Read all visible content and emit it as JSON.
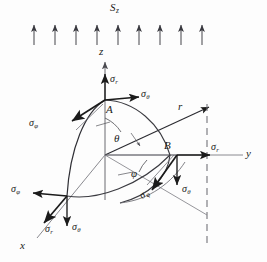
{
  "figure": {
    "title_label": "S",
    "title_sub": "z",
    "background_color": "#fdfdfd",
    "ink_color": "#1b1b1b",
    "thin_color": "#55555a"
  },
  "field_arrows": {
    "name": "uniform-field-arrows",
    "count": 9,
    "x_positions": [
      34,
      55,
      76,
      97,
      118,
      139,
      160,
      181,
      202
    ],
    "y_tail": 45,
    "y_head": 23
  },
  "axes": [
    {
      "id": "z",
      "label": "z",
      "sub": ""
    },
    {
      "id": "y",
      "label": "y",
      "sub": ""
    },
    {
      "id": "x",
      "label": "x",
      "sub": ""
    },
    {
      "id": "r",
      "label": "r",
      "sub": ""
    }
  ],
  "points": [
    {
      "id": "A",
      "label": "A",
      "stresses": [
        {
          "symbol": "σ",
          "sub": "r",
          "direction": "up"
        },
        {
          "symbol": "σ",
          "sub": "θ",
          "direction": "right"
        },
        {
          "symbol": "σ",
          "sub": "φ",
          "direction": "down-left"
        }
      ]
    },
    {
      "id": "B",
      "label": "B",
      "stresses": [
        {
          "symbol": "σ",
          "sub": "r",
          "direction": "right"
        },
        {
          "symbol": "σ",
          "sub": "θ",
          "direction": "down"
        },
        {
          "symbol": "σ",
          "sub": "φ",
          "direction": "down-left"
        }
      ]
    },
    {
      "id": "C",
      "label": "",
      "stresses": [
        {
          "symbol": "σ",
          "sub": "φ",
          "direction": "left"
        },
        {
          "symbol": "σ",
          "sub": "r",
          "direction": "down-left"
        },
        {
          "symbol": "σ",
          "sub": "θ",
          "direction": "down"
        }
      ]
    }
  ],
  "angles": [
    {
      "id": "theta",
      "label": "θ",
      "description": "polar-angle-from-z-axis"
    },
    {
      "id": "phi",
      "label": "φ",
      "description": "azimuthal-angle-in-xy-plane"
    }
  ],
  "labels": {
    "S_z": "S",
    "S_z_sub": "z",
    "z": "z",
    "y": "y",
    "x": "x",
    "r": "r",
    "A": "A",
    "B": "B",
    "theta": "θ",
    "phi": "φ",
    "sigma": "σ",
    "sub_r": "r",
    "sub_theta": "θ",
    "sub_phi": "φ"
  }
}
